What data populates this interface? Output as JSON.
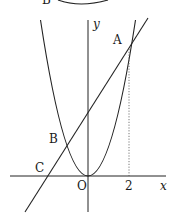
{
  "diagram": {
    "type": "coordinate-graph",
    "axes": {
      "x_label": "x",
      "y_label": "y",
      "origin_label": "O",
      "x_tick_labels": [
        "2"
      ]
    },
    "points": [
      {
        "id": "A",
        "label": "A",
        "math_x": 2,
        "math_y": 4
      },
      {
        "id": "B",
        "label": "B",
        "math_x": -1,
        "math_y": 1
      },
      {
        "id": "C",
        "label": "C",
        "math_x": -2,
        "math_y": 0
      },
      {
        "id": "O",
        "label": "O",
        "math_x": 0,
        "math_y": 0
      }
    ],
    "curves": [
      {
        "id": "parabola",
        "kind": "parabola",
        "vertex": "O"
      },
      {
        "id": "line",
        "kind": "line",
        "through": [
          "C",
          "B",
          "A"
        ]
      }
    ],
    "guides": [
      {
        "id": "dotted-A-to-x2",
        "kind": "dotted-vertical",
        "from": "A",
        "to_x_tick": "2"
      }
    ],
    "top_fragment": {
      "label": "B",
      "kind": "arc (cropped from previous figure)"
    },
    "colors": {
      "ink": "#222222",
      "background": "#ffffff"
    }
  }
}
